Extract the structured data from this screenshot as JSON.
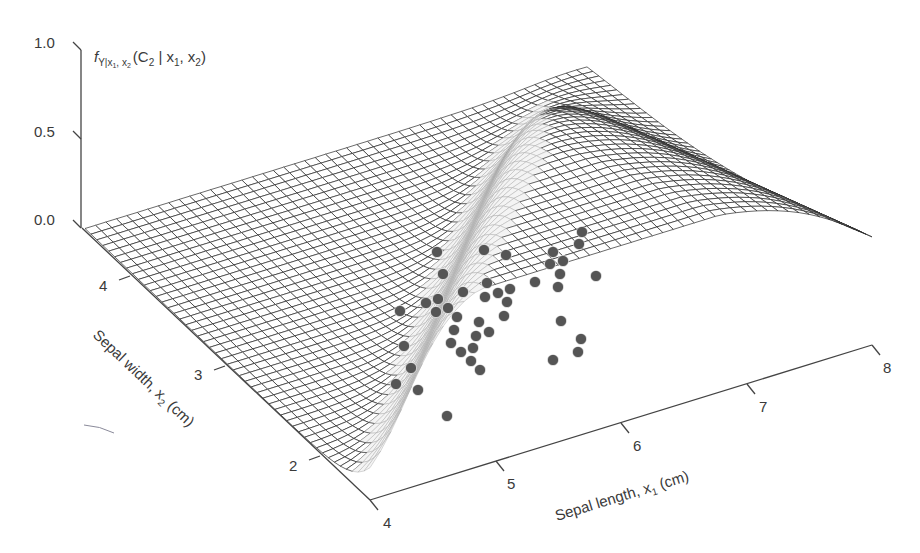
{
  "chart_data": {
    "type": "surface3d",
    "title": "",
    "zlabel": "f_{Y|x1,x2}(C2 | x1, x2)",
    "xlabel": "Sepal length, x1 (cm)",
    "ylabel": "Sepal width, x2 (cm)",
    "z_ticks": [
      "0.0",
      "0.5",
      "1.0"
    ],
    "x_ticks": [
      "4",
      "5",
      "6",
      "7",
      "8"
    ],
    "y_ticks": [
      "2",
      "3",
      "4"
    ],
    "xlim": [
      4,
      8
    ],
    "ylim": [
      1.5,
      4.5
    ],
    "zlim": [
      0,
      1
    ],
    "grid": false,
    "surface": {
      "description": "Posterior probability of class C2 (versicolor) given sepal length and width; near 0 in setosa region (small length, large width), rises to a ridge near 1 in the middle, falls at large length",
      "mesh_color": "#2a2a2a",
      "grid_n": 48
    },
    "scatter": {
      "color": "#555555",
      "label": "C2 samples (projected)",
      "points_px": [
        [
          437,
          252
        ],
        [
          484,
          250
        ],
        [
          506,
          255
        ],
        [
          553,
          252
        ],
        [
          582,
          232
        ],
        [
          579,
          244
        ],
        [
          443,
          274
        ],
        [
          550,
          264
        ],
        [
          563,
          261
        ],
        [
          560,
          274
        ],
        [
          596,
          276
        ],
        [
          535,
          282
        ],
        [
          558,
          287
        ],
        [
          463,
          292
        ],
        [
          487,
          283
        ],
        [
          485,
          297
        ],
        [
          498,
          293
        ],
        [
          510,
          289
        ],
        [
          507,
          302
        ],
        [
          504,
          316
        ],
        [
          426,
          303
        ],
        [
          438,
          299
        ],
        [
          448,
          308
        ],
        [
          436,
          312
        ],
        [
          400,
          311
        ],
        [
          457,
          317
        ],
        [
          479,
          322
        ],
        [
          489,
          332
        ],
        [
          454,
          330
        ],
        [
          476,
          336
        ],
        [
          451,
          343
        ],
        [
          473,
          348
        ],
        [
          461,
          352
        ],
        [
          471,
          361
        ],
        [
          480,
          370
        ],
        [
          561,
          321
        ],
        [
          581,
          339
        ],
        [
          578,
          352
        ],
        [
          553,
          360
        ],
        [
          404,
          346
        ],
        [
          411,
          368
        ],
        [
          396,
          384
        ],
        [
          418,
          390
        ],
        [
          447,
          416
        ]
      ]
    }
  },
  "axes": {
    "z": {
      "ticks": [
        {
          "label": "1.0",
          "y": 50
        },
        {
          "label": "0.5",
          "y": 139
        },
        {
          "label": "0.0",
          "y": 227
        }
      ],
      "title_main": "f",
      "title_sub": "Y|x",
      "title_sub2": "1",
      "title_sub3": ", x",
      "title_sub4": "2",
      "title_rest": "(C",
      "title_c_sub": "2",
      "title_end": " | x",
      "title_x1sub": "1",
      "title_comma": ", x",
      "title_x2sub": "2",
      "title_close": ")"
    },
    "x1": {
      "title": "Sepal length, x",
      "title_sub": "1",
      "title_unit": " (cm)"
    },
    "x2": {
      "title": "Sepal width, x",
      "title_sub": "2",
      "title_unit": " (cm)"
    }
  },
  "projection": {
    "origin": [
      370,
      500
    ],
    "e1": [
      125.5,
      -38.75
    ],
    "e2": [
      -95,
      -90.5
    ],
    "ez": [
      0,
      -177
    ],
    "x1_min": 4,
    "x1_max": 8,
    "x2_min": 1.5,
    "x2_max": 4.5
  }
}
